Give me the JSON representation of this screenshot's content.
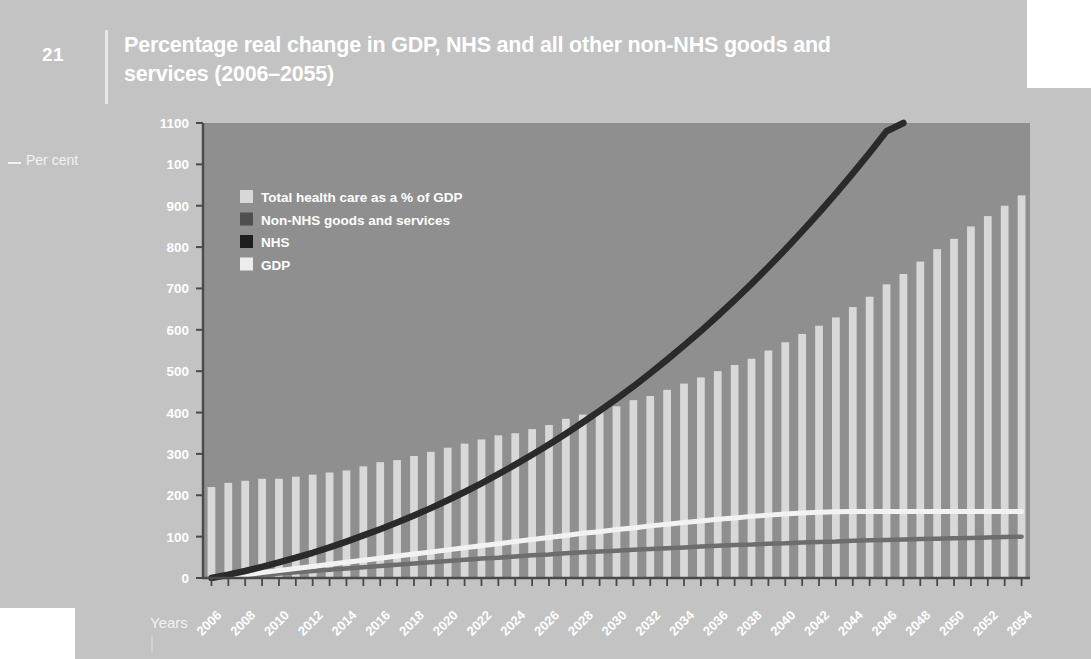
{
  "figure": {
    "number": "21",
    "title": "Percentage real change in GDP, NHS and all other non-NHS goods and services (2006–2055)",
    "y_axis_caption": "Per cent",
    "x_axis_caption": "Years"
  },
  "colors": {
    "page_background": "#c3c3c3",
    "plot_background": "#8f8f8f",
    "bar": "#d8d8d8",
    "nhs_line": "#2a2a2a",
    "gdp_line": "#f2f2f2",
    "non_nhs_line": "#6d6d6d",
    "axis": "#4a4a4a",
    "text": "#ffffff"
  },
  "chart_data": {
    "type": "bar",
    "title": "Percentage real change in GDP, NHS and all other non-NHS goods and services (2006–2055)",
    "xlabel": "Years",
    "ylabel": "Per cent",
    "ylim": [
      0,
      1100
    ],
    "grid": false,
    "legend_position": "top-left",
    "y_ticks": [
      "0",
      "100",
      "200",
      "300",
      "400",
      "500",
      "600",
      "700",
      "800",
      "900",
      "100",
      "1100"
    ],
    "y_tick_values": [
      0,
      100,
      200,
      300,
      400,
      500,
      600,
      700,
      800,
      900,
      1000,
      1100
    ],
    "x_tick_labels": [
      "2006",
      "2008",
      "2010",
      "2012",
      "2014",
      "2016",
      "2018",
      "2020",
      "2022",
      "2024",
      "2026",
      "2028",
      "2030",
      "2032",
      "2034",
      "2036",
      "2038",
      "2040",
      "2042",
      "2044",
      "2046",
      "2048",
      "2050",
      "2052",
      "2054"
    ],
    "x": [
      2006,
      2007,
      2008,
      2009,
      2010,
      2011,
      2012,
      2013,
      2014,
      2015,
      2016,
      2017,
      2018,
      2019,
      2020,
      2021,
      2022,
      2023,
      2024,
      2025,
      2026,
      2027,
      2028,
      2029,
      2030,
      2031,
      2032,
      2033,
      2034,
      2035,
      2036,
      2037,
      2038,
      2039,
      2040,
      2041,
      2042,
      2043,
      2044,
      2045,
      2046,
      2047,
      2048,
      2049,
      2050,
      2051,
      2052,
      2053,
      2054
    ],
    "series": [
      {
        "name": "Total health care as a % of GDP",
        "type": "bar",
        "color": "#d8d8d8",
        "values": [
          220,
          230,
          235,
          240,
          240,
          245,
          250,
          255,
          260,
          270,
          280,
          285,
          295,
          305,
          315,
          325,
          335,
          345,
          350,
          360,
          370,
          385,
          395,
          405,
          415,
          430,
          440,
          455,
          470,
          485,
          500,
          515,
          530,
          550,
          570,
          590,
          610,
          630,
          655,
          680,
          710,
          735,
          765,
          795,
          820,
          850,
          875,
          900,
          925
        ]
      },
      {
        "name": "Non-NHS goods and services",
        "type": "line",
        "color": "#6d6d6d",
        "values": [
          0,
          3,
          5,
          8,
          11,
          14,
          17,
          20,
          23,
          26,
          29,
          32,
          35,
          38,
          41,
          44,
          47,
          49,
          52,
          55,
          57,
          60,
          62,
          64,
          66,
          68,
          70,
          72,
          74,
          76,
          78,
          80,
          81,
          83,
          84,
          86,
          87,
          88,
          90,
          91,
          92,
          93,
          94,
          95,
          96,
          97,
          98,
          99,
          100
        ]
      },
      {
        "name": "NHS",
        "type": "line",
        "color": "#2a2a2a",
        "values": [
          0,
          8,
          17,
          27,
          38,
          49,
          61,
          74,
          88,
          103,
          118,
          134,
          151,
          169,
          188,
          208,
          229,
          251,
          274,
          298,
          323,
          349,
          376,
          404,
          433,
          463,
          495,
          528,
          562,
          597,
          634,
          672,
          711,
          752,
          794,
          838,
          883,
          930,
          978,
          1028,
          1080,
          1134,
          1190,
          1248,
          1308,
          1370,
          1434,
          1500,
          1568
        ]
      },
      {
        "name": "GDP",
        "type": "line",
        "color": "#f2f2f2",
        "values": [
          0,
          4,
          8,
          13,
          18,
          23,
          28,
          33,
          38,
          43,
          48,
          53,
          58,
          63,
          68,
          73,
          78,
          83,
          88,
          93,
          98,
          103,
          108,
          112,
          117,
          121,
          126,
          130,
          134,
          138,
          142,
          145,
          149,
          152,
          155,
          157,
          159,
          160,
          161,
          161,
          161,
          161,
          161,
          161,
          161,
          161,
          161,
          161,
          161
        ]
      }
    ],
    "legend": [
      {
        "label": "Total health care as a % of GDP",
        "color": "#d8d8d8"
      },
      {
        "label": "Non-NHS goods and services",
        "color": "#4f4f4f"
      },
      {
        "label": "NHS",
        "color": "#1e1e1e"
      },
      {
        "label": "GDP",
        "color": "#ededed"
      }
    ]
  }
}
